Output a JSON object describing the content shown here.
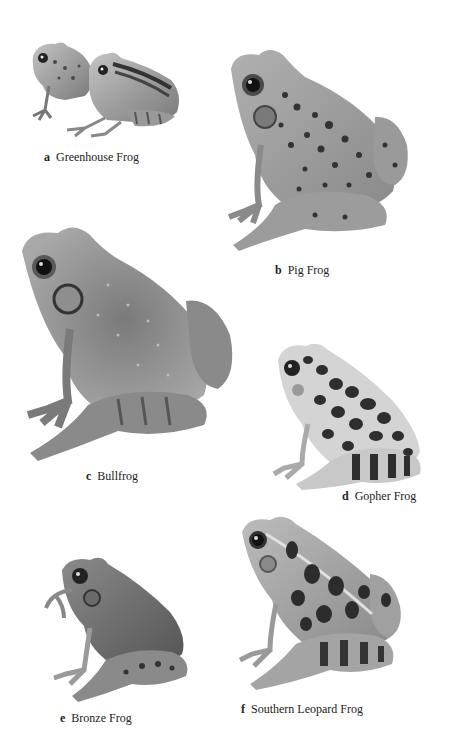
{
  "plate": {
    "description": "Field guide illustration plate of six frog species",
    "frogs": [
      {
        "letter": "a",
        "name": "Greenhouse Frog",
        "icon": "greenhouse-frog-illustration"
      },
      {
        "letter": "b",
        "name": "Pig Frog",
        "icon": "pig-frog-illustration"
      },
      {
        "letter": "c",
        "name": "Bullfrog",
        "icon": "bullfrog-illustration"
      },
      {
        "letter": "d",
        "name": "Gopher Frog",
        "icon": "gopher-frog-illustration"
      },
      {
        "letter": "e",
        "name": "Bronze Frog",
        "icon": "bronze-frog-illustration"
      },
      {
        "letter": "f",
        "name": "Southern Leopard Frog",
        "icon": "southern-leopard-frog-illustration"
      }
    ]
  },
  "colors": {
    "background": "#ffffff",
    "caption_text": "#222222",
    "frog_body_light": "#b8b8b8",
    "frog_body_mid": "#8c8c8c",
    "frog_spots": "#3a3a3a"
  }
}
